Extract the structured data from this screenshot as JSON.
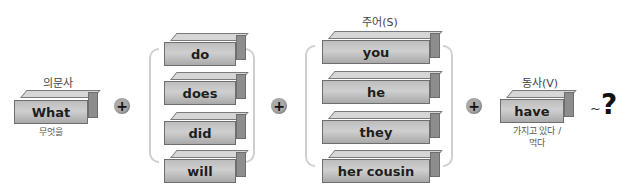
{
  "question_word": {
    "heading": "의문사",
    "word": "What",
    "meaning": "무엇을"
  },
  "auxiliaries": {
    "items": [
      "do",
      "does",
      "did",
      "will"
    ]
  },
  "subject": {
    "heading": "주어(S)",
    "items": [
      "you",
      "he",
      "they",
      "her cousin"
    ]
  },
  "verb": {
    "heading": "동사(V)",
    "word": "have",
    "meaning_line1": "가지고 있다 /",
    "meaning_line2": "먹다"
  },
  "operators": {
    "plus": "+",
    "tilde": "~",
    "question_mark": "?"
  },
  "colors": {
    "block_front": "#c2c2c2",
    "block_side": "#8d8d8d",
    "bracket": "#cfcfcf",
    "plus_circle": "#a9a9a9"
  }
}
